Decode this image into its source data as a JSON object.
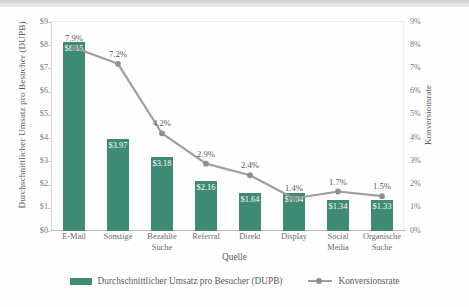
{
  "chart_data": {
    "type": "bar",
    "title": "",
    "xlabel": "Quelle",
    "ylabel": "Durchschnittlicher Umsatz pro Besucher (DUPB)",
    "y2label": "Konversionsrate",
    "categories": [
      "E-Mail",
      "Sonstige",
      "Bezahlte Suche",
      "Referral",
      "Direkt",
      "Display",
      "Social Media",
      "Organische Suche"
    ],
    "category_lines": [
      [
        "E-Mail"
      ],
      [
        "Sonstige"
      ],
      [
        "Bezahlte",
        "Suche"
      ],
      [
        "Referral"
      ],
      [
        "Direkt"
      ],
      [
        "Display"
      ],
      [
        "Social",
        "Media"
      ],
      [
        "Organische",
        "Suche"
      ]
    ],
    "series": [
      {
        "name": "Durchschnittlicher Umsatz pro Besucher (DUPB)",
        "type": "bar",
        "axis": "left",
        "color": "#3d8b74",
        "values": [
          8.15,
          3.97,
          3.18,
          2.16,
          1.64,
          1.64,
          1.34,
          1.33
        ],
        "labels": [
          "$8.15",
          "$3.97",
          "$3.18",
          "$2.16",
          "$1.64",
          "$1.64",
          "$1.34",
          "$1.33"
        ]
      },
      {
        "name": "Konversionsrate",
        "type": "line",
        "axis": "right",
        "color": "#9e9e9e",
        "values": [
          7.9,
          7.2,
          4.2,
          2.9,
          2.4,
          1.4,
          1.7,
          1.5
        ],
        "labels": [
          "7.9%",
          "7.2%",
          "4.2%",
          "2.9%",
          "2.4%",
          "1.4%",
          "1.7%",
          "1.5%"
        ]
      }
    ],
    "ylim": [
      0,
      9
    ],
    "y2lim": [
      0,
      9
    ],
    "yticks": [
      "$0",
      "$1",
      "$2",
      "$3",
      "$4",
      "$5",
      "$6",
      "$7",
      "$8",
      "$9"
    ],
    "y2ticks": [
      "0%",
      "1%",
      "2%",
      "3%",
      "4%",
      "5%",
      "6%",
      "7%",
      "8%",
      "9%"
    ],
    "grid": false,
    "legend_position": "bottom"
  },
  "legend": {
    "bar_label": "Durchschnittlicher Umsatz pro Besucher (DUPB)",
    "line_label": "Konversionsrate"
  }
}
